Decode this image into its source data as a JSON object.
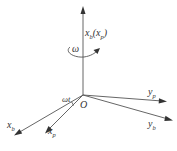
{
  "diagram": {
    "title": "",
    "origin_label": "O",
    "rotation_label": "ω",
    "angle_label": "ωt",
    "axes": [
      {
        "id": "vertical",
        "base": "x",
        "sub": "b",
        "suffix_base": "x",
        "suffix_sub": "p",
        "text": "x_b(x_p)"
      },
      {
        "id": "yp",
        "base": "y",
        "sub": "p",
        "text": "y_p"
      },
      {
        "id": "yb",
        "base": "y",
        "sub": "b",
        "text": "y_b"
      },
      {
        "id": "xb",
        "base": "x",
        "sub": "b",
        "text": "x_b"
      },
      {
        "id": "xp",
        "base": "x",
        "sub": "p",
        "text": "x_p"
      }
    ],
    "colors": {
      "line": "#555555",
      "text": "#333333",
      "background": "#ffffff"
    }
  }
}
